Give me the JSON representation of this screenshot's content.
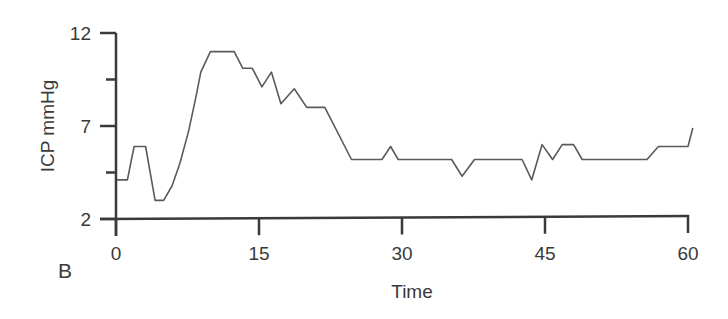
{
  "chart_data": {
    "type": "line",
    "title": "",
    "panel_label": "B",
    "xlabel": "Time",
    "ylabel": "ICP mmHg",
    "xlim": [
      0,
      60
    ],
    "ylim": [
      2,
      12
    ],
    "x_ticks": [
      0,
      15,
      30,
      45,
      60
    ],
    "x_tick_labels": [
      "0",
      "15",
      "30",
      "45",
      "60"
    ],
    "y_ticks": [
      2,
      7,
      12
    ],
    "y_tick_labels": [
      "2",
      "7",
      "12"
    ],
    "y_minor_ticks": [
      4.5,
      9.5
    ],
    "grid": false,
    "legend": null,
    "series": [
      {
        "name": "ICP",
        "color": "#5a5a5a",
        "x": [
          0.1,
          1.2,
          1.9,
          3.1,
          4.1,
          5.0,
          5.9,
          6.7,
          7.6,
          8.4,
          8.9,
          9.9,
          12.4,
          13.3,
          14.3,
          15.3,
          16.3,
          17.3,
          18.7,
          20.0,
          21.9,
          24.7,
          27.9,
          28.8,
          29.6,
          35.2,
          36.3,
          37.6,
          42.6,
          43.6,
          44.7,
          45.8,
          46.8,
          48.0,
          48.9,
          55.7,
          56.9,
          60.0,
          60.5
        ],
        "y": [
          4.1,
          4.1,
          5.9,
          5.9,
          3.0,
          3.0,
          3.8,
          5.0,
          6.7,
          8.6,
          9.9,
          11.0,
          11.0,
          10.1,
          10.1,
          9.1,
          9.9,
          8.2,
          9.0,
          8.0,
          8.0,
          5.2,
          5.2,
          5.9,
          5.2,
          5.2,
          4.3,
          5.2,
          5.2,
          4.1,
          6.0,
          5.2,
          6.0,
          6.0,
          5.2,
          5.2,
          5.9,
          5.9,
          6.9
        ]
      }
    ]
  }
}
